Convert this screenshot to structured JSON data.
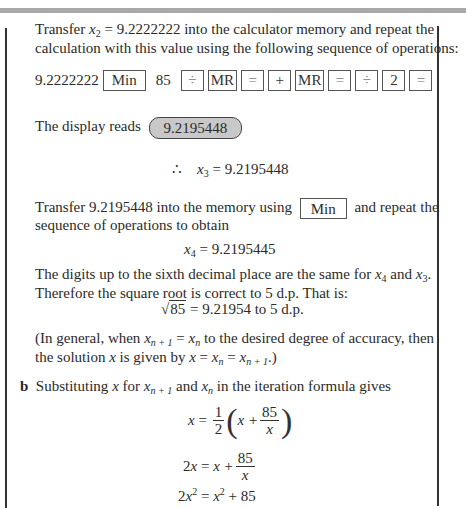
{
  "intro": {
    "line1_a": "Transfer ",
    "line1_var": "x",
    "line1_sub": "2",
    "line1_b": " = 9.2222222 into the calculator memory and repeat the",
    "line2": "calculation with this value using the following sequence of operations:"
  },
  "key_sequence": {
    "start_value": "9.2222222",
    "keys": [
      "Min",
      "85",
      "÷",
      "MR",
      "=",
      "+",
      "MR",
      "=",
      "÷",
      "2",
      "="
    ]
  },
  "display": {
    "label": "The display reads",
    "value": "9.2195448"
  },
  "x3_line": {
    "therefore": "∴",
    "var": "x",
    "sub": "3",
    "rest": " = 9.2195448"
  },
  "transfer2": {
    "line1_a": "Transfer 9.2195448 into the memory using",
    "key": "Min",
    "line1_b": "and repeat the",
    "line2": "sequence of operations to obtain"
  },
  "x4_line": {
    "var": "x",
    "sub": "4",
    "rest": " = 9.2195445"
  },
  "digits_para": {
    "line1_a": "The digits up to the sixth decimal place are the same for ",
    "var_a": "x",
    "sub_a": "4",
    "and": " and ",
    "var_b": "x",
    "sub_b": "3",
    "end": ".",
    "line2": "Therefore the square root is correct to 5 d.p. That is:"
  },
  "sqrt_line": {
    "radicand": "85",
    "rest": " = 9.21954 to 5 d.p."
  },
  "general_note": {
    "line1_a": "(In general, when ",
    "x": "x",
    "n1": "n + 1",
    "eq": " = ",
    "n": "n",
    "line1_b": " to the desired degree of accuracy, then",
    "line2_a": "the solution ",
    "line2_b": " is given by ",
    "line2_c": ".)"
  },
  "part_b": {
    "label": "b",
    "text_a": "Substituting ",
    "text_b": " for ",
    "text_c": " and ",
    "text_d": " in the iteration formula gives"
  },
  "equations": {
    "eq1_lhs": "x",
    "eq1_half_num": "1",
    "eq1_half_den": "2",
    "eq1_inner": "x +",
    "eq1_frac_num": "85",
    "eq1_frac_den": "x",
    "eq2_lhs": "2x",
    "eq2_inner": "x +",
    "eq2_frac_num": "85",
    "eq2_frac_den": "x",
    "eq3_lhs": "2x",
    "eq3_rhs_a": "x",
    "eq3_rhs_b": " + 85",
    "sq": "2"
  },
  "colors": {
    "text": "#2a2a2a",
    "display_bg": "#c8c8c8",
    "topbar": "#a9a9a9"
  }
}
